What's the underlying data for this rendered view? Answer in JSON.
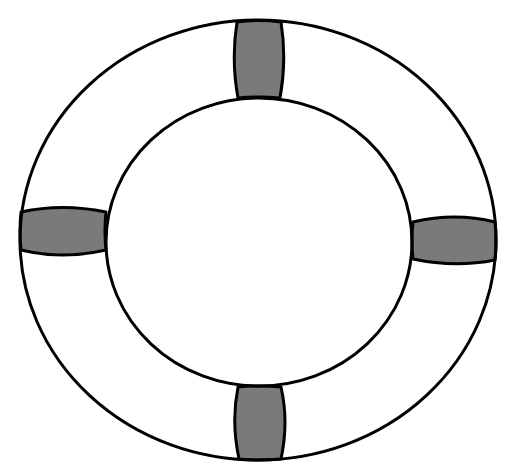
{
  "image": {
    "subject": "lifebuoy",
    "background_color": "#ffffff",
    "stroke_color": "#000000",
    "ring_fill": "#ffffff",
    "strap_fill": "#7a7a7a",
    "stroke_width": 3
  },
  "ring": {
    "outer": {
      "cx": 258,
      "cy": 240,
      "rx": 238,
      "ry": 220
    },
    "inner": {
      "cx": 259,
      "cy": 242,
      "rx": 153,
      "ry": 144
    }
  },
  "straps": [
    {
      "position": "top",
      "label": "top-strap"
    },
    {
      "position": "left",
      "label": "left-strap"
    },
    {
      "position": "right",
      "label": "right-strap"
    },
    {
      "position": "bottom",
      "label": "bottom-strap"
    }
  ]
}
